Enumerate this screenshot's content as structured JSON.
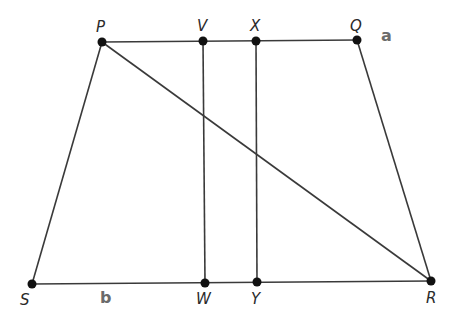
{
  "diagram": {
    "type": "trapezoid-with-diagonal-and-parallels",
    "colors": {
      "line": "#3a3a3a",
      "point": "#111111",
      "vertex_label": "#2a2a2a",
      "side_label": "#6b6b6b"
    },
    "points": {
      "P": {
        "label": "P",
        "x": 102,
        "y": 42
      },
      "V": {
        "label": "V",
        "x": 203,
        "y": 41
      },
      "X": {
        "label": "X",
        "x": 256,
        "y": 41
      },
      "Q": {
        "label": "Q",
        "x": 357,
        "y": 40
      },
      "S": {
        "label": "S",
        "x": 32,
        "y": 284
      },
      "W": {
        "label": "W",
        "x": 205,
        "y": 283
      },
      "Y": {
        "label": "Y",
        "x": 257,
        "y": 282
      },
      "R": {
        "label": "R",
        "x": 431,
        "y": 281
      }
    },
    "segments": [
      {
        "from": "P",
        "to": "Q"
      },
      {
        "from": "S",
        "to": "R"
      },
      {
        "from": "P",
        "to": "S"
      },
      {
        "from": "Q",
        "to": "R"
      },
      {
        "from": "P",
        "to": "R"
      },
      {
        "from": "V",
        "to": "W"
      },
      {
        "from": "X",
        "to": "Y"
      }
    ],
    "side_labels": {
      "top": {
        "text": "a",
        "x": 381,
        "y": 41
      },
      "bottom": {
        "text": "b",
        "x": 100,
        "y": 302
      }
    }
  }
}
